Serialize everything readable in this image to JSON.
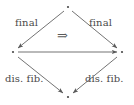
{
  "diagram": {
    "type": "commutative-square",
    "background_color": "#ffffff",
    "stroke_color": "#5a5a5a",
    "text_color": "#4a4a4a",
    "vertices": [
      {
        "name": "top",
        "x": 68,
        "y": 7,
        "marker": "dot"
      },
      {
        "name": "left",
        "x": 13,
        "y": 52,
        "marker": "dot"
      },
      {
        "name": "right",
        "x": 122,
        "y": 52,
        "marker": "dot"
      },
      {
        "name": "bottom",
        "x": 68,
        "y": 97,
        "marker": "dot"
      }
    ],
    "edges": [
      {
        "name": "top-to-left",
        "from": "top",
        "to": "left",
        "label": "final",
        "direction": "down-left"
      },
      {
        "name": "top-to-right",
        "from": "top",
        "to": "right",
        "label": "final",
        "direction": "down-right"
      },
      {
        "name": "left-to-right",
        "from": "left",
        "to": "right",
        "label": "",
        "direction": "right"
      },
      {
        "name": "left-to-bottom",
        "from": "left",
        "to": "bottom",
        "label": "dis. fib.",
        "direction": "down-right"
      },
      {
        "name": "right-to-bottom",
        "from": "right",
        "to": "bottom",
        "label": "dis. fib.",
        "direction": "down-left"
      }
    ],
    "labels": {
      "final_left": "final",
      "final_right": "final",
      "dis_fib_left": "dis. fib.",
      "dis_fib_right": "dis. fib.",
      "implies": "⇒"
    }
  }
}
